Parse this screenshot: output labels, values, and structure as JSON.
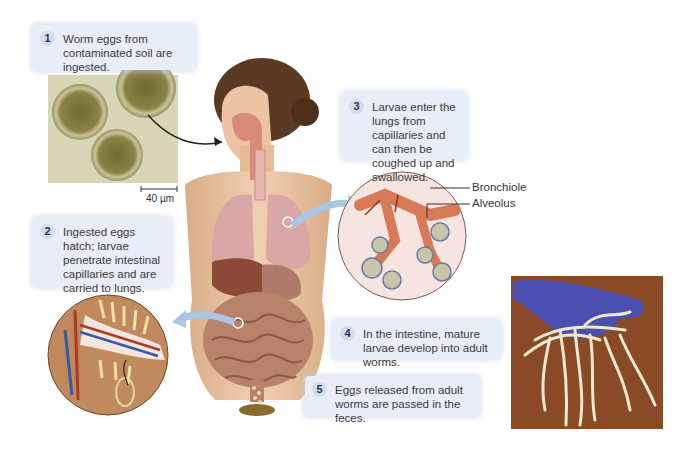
{
  "figure": {
    "steps": [
      {
        "number": "1",
        "text": "Worm eggs from contaminated soil are ingested."
      },
      {
        "number": "2",
        "text": "Ingested eggs hatch; larvae penetrate intestinal capillaries and are carried to lungs."
      },
      {
        "number": "3",
        "text": "Larvae enter the lungs from capillaries and can then be coughed up and swallowed."
      },
      {
        "number": "4",
        "text": "In the intestine, mature larvae develop into adult worms."
      },
      {
        "number": "5",
        "text": "Eggs released from adult worms are passed in the feces."
      }
    ],
    "labels": {
      "bronchiole": "Bronchiole",
      "alveolus": "Alveolus",
      "scale_bar": "40 µm"
    },
    "images": {
      "eggs_micrograph": "microscope-eggs-image",
      "human_body": "human-anatomy-illustration",
      "lung_inset": "lung-alveoli-inset",
      "intestine_inset": "intestinal-villi-inset",
      "worms_photo": "gloved-hand-worms-photo"
    },
    "colors": {
      "callout_bg": "#e8eef7",
      "number_badge": "#d3dcec",
      "arrow_blue": "#a9c6e4",
      "skin": "#e9c3a2",
      "glove": "#4b4fb0",
      "photo_bg": "#8a4a25"
    }
  }
}
